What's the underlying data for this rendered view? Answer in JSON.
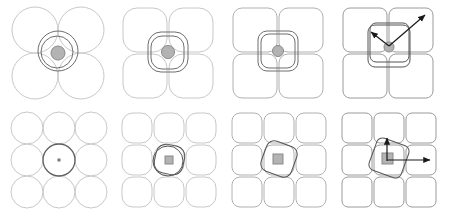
{
  "figure": {
    "title": "",
    "caption": "",
    "rows": 2,
    "columns": 4,
    "background_color": "#ffffff"
  },
  "colors": {
    "cell_stroke_light": "#c8c8c8",
    "cell_stroke_mid": "#9a9a9a",
    "cell_stroke_dark": "#6e6e6e",
    "overlay_stroke": "#555555",
    "marker_fill": "#b3b3b3",
    "marker_stroke": "#808080",
    "arrow_color": "#1a1a1a"
  },
  "panels": [
    {
      "id": "panel-r1c1",
      "name": "circles-2x2-concentric-circles",
      "grid": {
        "rows": 2,
        "columns": 2,
        "cell_shape": "circle",
        "cell_corner_radius": 0
      },
      "overlay": {
        "shape": "concentric-circles",
        "count": 2,
        "rotation_deg": 0
      },
      "marker": {
        "shape": "circle",
        "size": 14,
        "label": ""
      },
      "arrows": []
    },
    {
      "id": "panel-r1c2",
      "name": "rounded-squares-2x2-concentric-rounded",
      "grid": {
        "rows": 2,
        "columns": 2,
        "cell_shape": "rounded-square",
        "cell_corner_radius": 14
      },
      "overlay": {
        "shape": "concentric-rounded-squares",
        "count": 2,
        "rotation_deg": 0
      },
      "marker": {
        "shape": "circle",
        "size": 13,
        "label": ""
      },
      "arrows": []
    },
    {
      "id": "panel-r1c3",
      "name": "squares-2x2-concentric-rounded-tight",
      "grid": {
        "rows": 2,
        "columns": 2,
        "cell_shape": "rounded-square",
        "cell_corner_radius": 9
      },
      "overlay": {
        "shape": "concentric-rounded-squares",
        "count": 2,
        "rotation_deg": 0
      },
      "marker": {
        "shape": "circle",
        "size": 11,
        "label": ""
      },
      "arrows": []
    },
    {
      "id": "panel-r1c4",
      "name": "squares-2x2-with-arrows",
      "grid": {
        "rows": 2,
        "columns": 2,
        "cell_shape": "rounded-square",
        "cell_corner_radius": 7
      },
      "overlay": {
        "shape": "concentric-rounded-squares",
        "count": 2,
        "rotation_deg": 0
      },
      "marker": {
        "shape": "circle",
        "size": 10,
        "label": ""
      },
      "arrows": [
        {
          "name": "arrow-up-right",
          "direction": "up-right",
          "length": 46,
          "angle_deg": -42
        },
        {
          "name": "arrow-up-left",
          "direction": "up-left",
          "length": 22,
          "angle_deg": -140
        }
      ]
    },
    {
      "id": "panel-r2c1",
      "name": "circles-3x3-single-circle",
      "grid": {
        "rows": 3,
        "columns": 3,
        "cell_shape": "circle",
        "cell_corner_radius": 0
      },
      "overlay": {
        "shape": "circle",
        "count": 1,
        "rotation_deg": 0
      },
      "marker": {
        "shape": "square",
        "size": 3,
        "label": ""
      },
      "arrows": []
    },
    {
      "id": "panel-r2c2",
      "name": "rounded-squares-3x3-rotated-outline",
      "grid": {
        "rows": 3,
        "columns": 3,
        "cell_shape": "rounded-square",
        "cell_corner_radius": 11
      },
      "overlay": {
        "shape": "rounded-square-and-circle",
        "count": 2,
        "rotation_deg": 12
      },
      "marker": {
        "shape": "square",
        "size": 8,
        "label": ""
      },
      "arrows": []
    },
    {
      "id": "panel-r2c3",
      "name": "squares-3x3-rotated-outline",
      "grid": {
        "rows": 3,
        "columns": 3,
        "cell_shape": "rounded-square",
        "cell_corner_radius": 8
      },
      "overlay": {
        "shape": "rotated-rounded-square",
        "count": 1,
        "rotation_deg": 20
      },
      "marker": {
        "shape": "square",
        "size": 10,
        "label": ""
      },
      "arrows": []
    },
    {
      "id": "panel-r2c4",
      "name": "squares-3x3-with-arrows",
      "grid": {
        "rows": 3,
        "columns": 3,
        "cell_shape": "rounded-square",
        "cell_corner_radius": 6
      },
      "overlay": {
        "shape": "rotated-rounded-square",
        "count": 1,
        "rotation_deg": 20
      },
      "marker": {
        "shape": "square",
        "size": 11,
        "label": ""
      },
      "arrows": [
        {
          "name": "arrow-up",
          "direction": "up",
          "length": 20,
          "angle_deg": -90
        },
        {
          "name": "arrow-right",
          "direction": "right",
          "length": 42,
          "angle_deg": 0
        }
      ]
    }
  ]
}
